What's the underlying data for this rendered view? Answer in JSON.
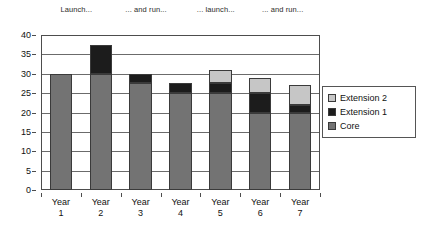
{
  "chart_data": {
    "type": "bar",
    "stacked": true,
    "title": "",
    "xlabel": "",
    "ylabel": "",
    "ylim": [
      0,
      40
    ],
    "ytick_step": 5,
    "yticks": [
      0,
      5,
      10,
      15,
      20,
      25,
      30,
      35,
      40
    ],
    "grid": true,
    "legend_position": "right",
    "categories": [
      "Year 1",
      "Year 2",
      "Year 3",
      "Year 4",
      "Year 5",
      "Year 6",
      "Year 7"
    ],
    "series": [
      {
        "name": "Core",
        "color": "#737373",
        "values": [
          30,
          30,
          27.5,
          25,
          25,
          20,
          20
        ]
      },
      {
        "name": "Extension 1",
        "color": "#1c1c1c",
        "values": [
          0,
          7.5,
          2.5,
          2.5,
          2.5,
          5,
          2
        ]
      },
      {
        "name": "Extension 2",
        "color": "#c6c6c6",
        "values": [
          0,
          0,
          0,
          0,
          3.5,
          4,
          5
        ]
      }
    ],
    "totals": [
      30,
      37.5,
      30,
      27.5,
      31,
      29,
      27
    ],
    "annotations": [
      {
        "text": "Launch...",
        "x": 0.13
      },
      {
        "text": "... and run...",
        "x": 0.38
      },
      {
        "text": "... launch...",
        "x": 0.63
      },
      {
        "text": "... and run...",
        "x": 0.87
      }
    ]
  },
  "legend": {
    "entries": [
      {
        "label": "Extension 2",
        "color": "#c6c6c6"
      },
      {
        "label": "Extension 1",
        "color": "#1c1c1c"
      },
      {
        "label": "Core",
        "color": "#737373"
      }
    ]
  },
  "colors": {
    "core": "#737373",
    "extension_1": "#1c1c1c",
    "extension_2": "#c6c6c6",
    "axis": "#4d4d4d",
    "grid": "#6b6b6b",
    "background": "#ffffff"
  }
}
